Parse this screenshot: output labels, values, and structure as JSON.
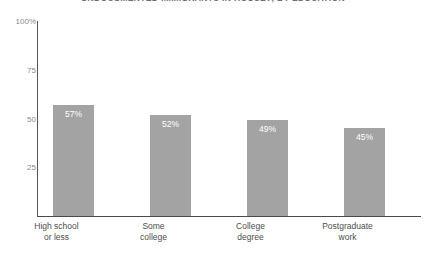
{
  "chart_data": {
    "type": "bar",
    "title": "UNDOCUMENTED IMMIGRANTS IN HOUSE?, BY EDUCATION",
    "xlabel": "",
    "ylabel": "",
    "categories": [
      "High school or less",
      "Some college",
      "College degree",
      "Postgraduate work"
    ],
    "category_lines": [
      [
        "High school",
        "or less"
      ],
      [
        "Some",
        "college"
      ],
      [
        "College",
        "degree"
      ],
      [
        "Postgraduate",
        "work"
      ]
    ],
    "values": [
      57,
      52,
      49,
      45
    ],
    "value_labels": [
      "57%",
      "52%",
      "49%",
      "45%"
    ],
    "ylim": [
      0,
      100
    ],
    "yticks": [
      100,
      75,
      50,
      25
    ],
    "ytick_labels": [
      "100%",
      "75",
      "50",
      "25"
    ],
    "grid": false,
    "legend": false,
    "bar_color": "#a3a3a3",
    "value_label_color": "#ffffff",
    "axis_color": "#4a4a4a",
    "tick_label_color": "#8a8a8a",
    "category_label_color": "#4d4d4d",
    "title_color": "#6e6e6e"
  }
}
